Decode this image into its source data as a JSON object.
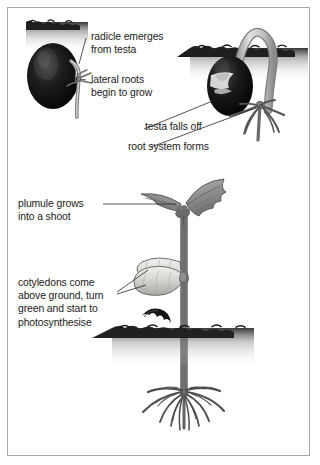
{
  "diagram": {
    "background_color": "#ffffff",
    "border_color": "#a8a8a8",
    "ink_color": "#1b1b1b",
    "soil_color": "#262626",
    "seed_dark_color": "#111111",
    "cotyledon_color": "#d8d8d4",
    "leaf_color": "#9a9a9a",
    "stem_color": "#c9c9c9",
    "labels": [
      {
        "id": "radicle",
        "text": "radicle emerges\nfrom testa",
        "target": "emerging-radicle-stage-one"
      },
      {
        "id": "lateral-roots",
        "text": "lateral roots\nbegin to grow",
        "target": "lateral-roots-stage-one"
      },
      {
        "id": "testa-falls-off",
        "text": "testa falls off",
        "target": "split-testa-stage-two"
      },
      {
        "id": "root-system",
        "text": "root system forms",
        "target": "root-system-stage-two"
      },
      {
        "id": "plumule",
        "text": "plumule grows\ninto a shoot",
        "target": "leaves-stage-three"
      },
      {
        "id": "cotyledons",
        "text": "cotyledons come\nabove ground, turn\ngreen and start to\nphotosynthesise",
        "target": "cotyledon-pair-stage-three"
      }
    ],
    "stages": [
      {
        "id": "stage-one",
        "name": "seed-with-emerging-radicle"
      },
      {
        "id": "stage-two",
        "name": "hypocotyl-arch-with-roots"
      },
      {
        "id": "stage-three",
        "name": "seedling-with-leaves-and-cotyledons"
      }
    ]
  }
}
